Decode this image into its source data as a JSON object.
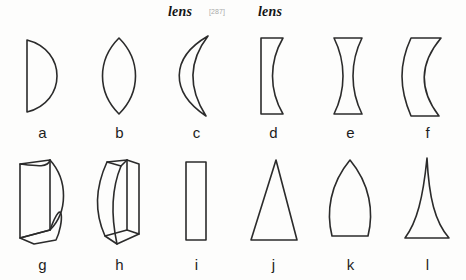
{
  "header": {
    "headword_left": "lens",
    "headword_right": "lens",
    "entry_marker": "[287]"
  },
  "figure": {
    "rows": [
      {
        "items": [
          {
            "label": "a",
            "shape": "plano-convex-lens"
          },
          {
            "label": "b",
            "shape": "biconvex-lens"
          },
          {
            "label": "c",
            "shape": "crescent-meniscus-lens"
          },
          {
            "label": "d",
            "shape": "plano-concave-lens"
          },
          {
            "label": "e",
            "shape": "biconcave-lens"
          },
          {
            "label": "f",
            "shape": "negative-meniscus-lens"
          }
        ]
      },
      {
        "items": [
          {
            "label": "g",
            "shape": "convex-cylindrical-lens-3d"
          },
          {
            "label": "h",
            "shape": "concave-cylindrical-lens-3d"
          },
          {
            "label": "i",
            "shape": "rectangular-plate"
          },
          {
            "label": "j",
            "shape": "triangular-prism"
          },
          {
            "label": "k",
            "shape": "ogive-pointed-lens"
          },
          {
            "label": "l",
            "shape": "concave-sided-prism"
          }
        ]
      }
    ]
  }
}
